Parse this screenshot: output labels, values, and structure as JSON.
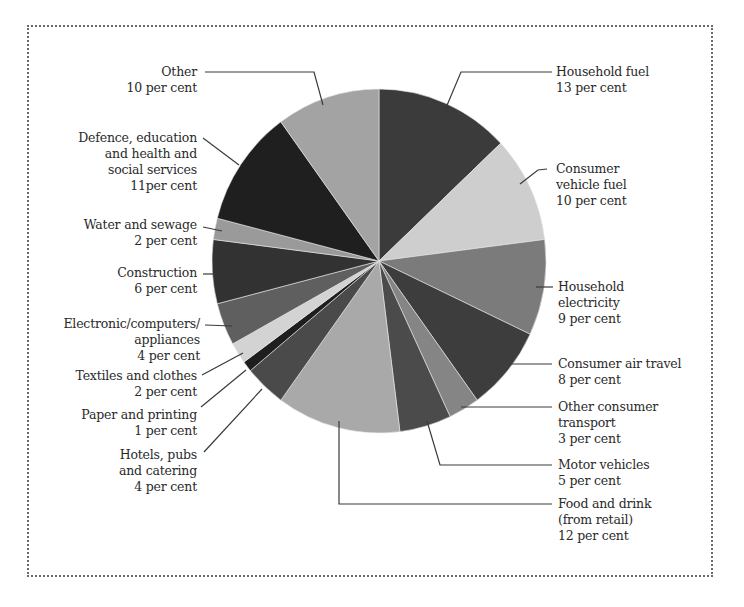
{
  "chart_data": {
    "type": "pie",
    "title": "",
    "start_angle_deg": 0,
    "direction": "clockwise",
    "unit": "per cent",
    "slices": [
      {
        "label": "Household fuel",
        "value": 13,
        "value_text": "13 per cent",
        "color": "#3b3b3b"
      },
      {
        "label": "Consumer vehicle fuel",
        "value": 10,
        "value_text": "10 per cent",
        "color": "#cecece"
      },
      {
        "label": "Household electricity",
        "value": 9,
        "value_text": "9 per cent",
        "color": "#7b7b7b"
      },
      {
        "label": "Consumer air travel",
        "value": 8,
        "value_text": "8 per cent",
        "color": "#3d3d3d"
      },
      {
        "label": "Other consumer transport",
        "value": 3,
        "value_text": "3 per cent",
        "color": "#858585"
      },
      {
        "label": "Motor vehicles",
        "value": 5,
        "value_text": "5 per cent",
        "color": "#4b4b4b"
      },
      {
        "label": "Food and drink (from retail)",
        "value": 12,
        "value_text": "12 per cent",
        "color": "#a9a9a9"
      },
      {
        "label": "Hotels, pubs and catering",
        "value": 4,
        "value_text": "4 per cent",
        "color": "#4a4a4a"
      },
      {
        "label": "Paper and printing",
        "value": 1,
        "value_text": "1 per cent",
        "color": "#1e1e1e"
      },
      {
        "label": "Textiles and clothes",
        "value": 2,
        "value_text": "2 per cent",
        "color": "#d3d3d3"
      },
      {
        "label": "Electronic/computers/appliances",
        "value": 4,
        "value_text": "4 per cent",
        "color": "#5f5f5f"
      },
      {
        "label": "Construction",
        "value": 6,
        "value_text": "6 per cent",
        "color": "#323232"
      },
      {
        "label": "Water and sewage",
        "value": 2,
        "value_text": "2 per cent",
        "color": "#9a9a9a"
      },
      {
        "label": "Defence, education and health and social services",
        "value": 11,
        "value_text": "11per cent",
        "color": "#1f1f1f"
      },
      {
        "label": "Other",
        "value": 10,
        "value_text": "10 per cent",
        "color": "#a3a3a3"
      }
    ],
    "legend": "none (callout labels with leader lines)",
    "center": [
      379,
      261
    ],
    "radius": [
      167,
      172
    ]
  },
  "labels": {
    "household_fuel": [
      "Household fuel",
      "13 per cent"
    ],
    "consumer_vehicle_fuel": [
      "Consumer",
      "vehicle fuel",
      "10 per cent"
    ],
    "household_electricity": [
      "Household",
      "electricity",
      "9 per cent"
    ],
    "consumer_air_travel": [
      "Consumer air travel",
      "8 per cent"
    ],
    "other_consumer_transport": [
      "Other consumer",
      "transport",
      "3 per cent"
    ],
    "motor_vehicles": [
      "Motor vehicles",
      "5 per cent"
    ],
    "food_and_drink": [
      "Food and drink",
      "(from retail)",
      "12 per cent"
    ],
    "hotels": [
      "Hotels, pubs",
      "and catering",
      "4 per cent"
    ],
    "paper": [
      "Paper and printing",
      "1 per cent"
    ],
    "textiles": [
      "Textiles and clothes",
      "2 per cent"
    ],
    "electronic": [
      "Electronic/computers/",
      "appliances",
      "4 per cent"
    ],
    "construction": [
      "Construction",
      "6 per cent"
    ],
    "water": [
      "Water and sewage",
      "2 per cent"
    ],
    "defence": [
      "Defence, education",
      "and health and",
      "social services",
      "11per cent"
    ],
    "other": [
      "Other",
      "10 per cent"
    ]
  },
  "colors": {
    "leader_line": "#3a3a3a",
    "frame": "#6a6a6a",
    "text": "#2a2a2a"
  }
}
